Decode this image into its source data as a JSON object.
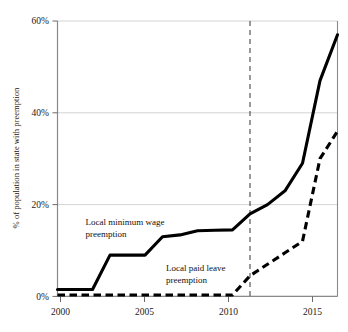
{
  "chart_data": {
    "type": "line",
    "title": "",
    "subtitle": "",
    "xlabel": "",
    "ylabel": "% of population in state with preemption",
    "xlim": [
      2000,
      2016
    ],
    "ylim": [
      0,
      60
    ],
    "grid": true,
    "grid_axis": "y",
    "legend_position": "inline-annotations",
    "x_tick_labels": [
      "2000",
      "2005",
      "2010",
      "2015"
    ],
    "x_ticks": [
      2000,
      2005,
      2010,
      2015
    ],
    "y_tick_labels": [
      "0%",
      "20%",
      "40%",
      "60%"
    ],
    "y_ticks": [
      0,
      20,
      40,
      60
    ],
    "series": [
      {
        "name": "Local minimum wage preemption",
        "style": "solid",
        "color": "#000000",
        "x": [
          2000,
          2001,
          2002,
          2003,
          2004,
          2005,
          2006,
          2007,
          2008,
          2009,
          2010,
          2011,
          2012,
          2013,
          2014,
          2015,
          2016
        ],
        "values": [
          1.5,
          1.5,
          1.5,
          9.0,
          9.0,
          9.0,
          13.0,
          13.4,
          14.3,
          14.4,
          14.5,
          18.0,
          20.0,
          23.0,
          29.0,
          47.0,
          57.0
        ]
      },
      {
        "name": "Local paid leave preemption",
        "style": "dashed",
        "color": "#000000",
        "x": [
          2000,
          2001,
          2002,
          2003,
          2004,
          2005,
          2006,
          2007,
          2008,
          2009,
          2010,
          2011,
          2012,
          2013,
          2014,
          2015,
          2016
        ],
        "values": [
          0.3,
          0.3,
          0.3,
          0.3,
          0.3,
          0.3,
          0.3,
          0.3,
          0.3,
          0.3,
          0.3,
          4.5,
          7.0,
          9.5,
          12.0,
          30.0,
          36.0
        ]
      }
    ],
    "annotations": [
      {
        "name": "minimum-wage-annotation",
        "line1": "Local minimum wage",
        "line2": "preemption",
        "x": 2001.6,
        "y": 15.5
      },
      {
        "name": "paid-leave-annotation",
        "line1": "Local paid leave",
        "line2": "preemption",
        "x": 2006.2,
        "y": 5.6
      }
    ],
    "reference_lines": [
      {
        "name": "year-2011-marker",
        "orientation": "vertical",
        "x": 2011,
        "style": "dashed",
        "color": "#555555"
      }
    ]
  }
}
